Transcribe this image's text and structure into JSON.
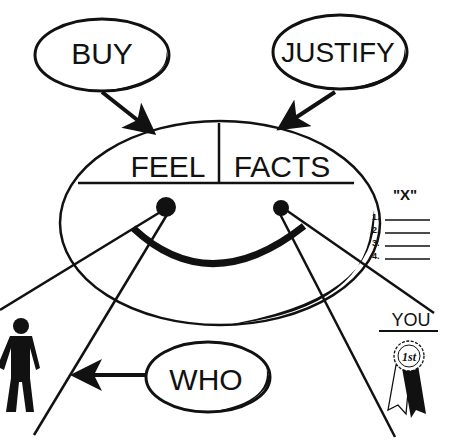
{
  "bubbles": {
    "buy": "BUY",
    "justify": "JUSTIFY",
    "who": "WHO"
  },
  "face": {
    "left_label": "FEEL",
    "right_label": "FACTS"
  },
  "list": {
    "title": "\"X\"",
    "items": [
      "1.",
      "2.",
      "3.",
      "4."
    ]
  },
  "you": {
    "label": "YOU",
    "ribbon_text": "1st"
  },
  "colors": {
    "ink": "#111111",
    "background": "#ffffff"
  }
}
